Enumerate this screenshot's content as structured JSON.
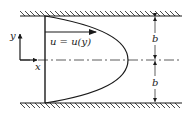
{
  "diagram": {
    "colors": {
      "stroke": "#1a1a1a",
      "background": "#ffffff",
      "centerline": "#333333"
    },
    "labels": {
      "velocity": "u = u(y)",
      "x_axis": "x",
      "y_axis": "y",
      "half_gap_top": "b",
      "half_gap_bottom": "b"
    },
    "elements": {
      "top_wall": "hatched fixed wall",
      "bottom_wall": "hatched fixed wall",
      "centerline": "dash-dot symmetry line",
      "profile": "parabolic velocity profile",
      "dimension": "two half-gaps of width b"
    }
  }
}
